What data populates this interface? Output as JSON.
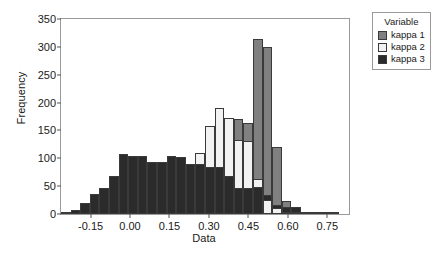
{
  "chart_data": {
    "type": "bar",
    "subtype": "overlaid-histogram",
    "title": "",
    "xlabel": "Data",
    "ylabel": "Frequency",
    "xlim": [
      -0.2625,
      0.8325
    ],
    "ylim": [
      0,
      350
    ],
    "xticks": [
      "-0.15",
      "0.00",
      "0.15",
      "0.30",
      "0.45",
      "0.60",
      "0.75"
    ],
    "xtick_values": [
      -0.15,
      0.0,
      0.15,
      0.3,
      0.45,
      0.6,
      0.75
    ],
    "yticks": [
      "0",
      "50",
      "100",
      "150",
      "200",
      "250",
      "300",
      "350"
    ],
    "ytick_values": [
      0,
      50,
      100,
      150,
      200,
      250,
      300,
      350
    ],
    "grid": false,
    "bin_width": 0.0365,
    "bin_centers": [
      -0.2445,
      -0.208,
      -0.1715,
      -0.135,
      -0.0985,
      -0.062,
      -0.0255,
      0.011,
      0.0475,
      0.084,
      0.1205,
      0.157,
      0.1935,
      0.23,
      0.2665,
      0.303,
      0.3395,
      0.376,
      0.4125,
      0.449,
      0.4855,
      0.522,
      0.5585,
      0.595,
      0.6315,
      0.668,
      0.7045,
      0.741,
      0.7775
    ],
    "legend": {
      "title": "Variable",
      "position": "right-top",
      "entries": [
        "kappa 1",
        "kappa 2",
        "kappa 3"
      ]
    },
    "series": [
      {
        "name": "kappa 1",
        "color": "#808080",
        "values": [
          0,
          0,
          0,
          0,
          0,
          0,
          0,
          0,
          0,
          0,
          0,
          0,
          0,
          0,
          0,
          0,
          0,
          0,
          171,
          164,
          315,
          300,
          120,
          23,
          2,
          1,
          0,
          0,
          0
        ]
      },
      {
        "name": "kappa 2",
        "color": "#f2f2f2",
        "values": [
          0,
          0,
          0,
          0,
          0,
          0,
          0,
          0,
          0,
          0,
          0,
          0,
          0,
          0,
          110,
          158,
          190,
          172,
          133,
          131,
          62,
          25,
          11,
          3,
          1,
          0,
          0,
          0,
          0
        ]
      },
      {
        "name": "kappa 3",
        "color": "#2b2b2b",
        "values": [
          2,
          7,
          20,
          36,
          47,
          68,
          107,
          105,
          104,
          93,
          93,
          104,
          103,
          89,
          89,
          84,
          84,
          68,
          46,
          46,
          49,
          34,
          16,
          13,
          12,
          3,
          2,
          1,
          1
        ]
      }
    ]
  },
  "axes": {
    "ylabel": "Frequency",
    "xlabel": "Data"
  }
}
